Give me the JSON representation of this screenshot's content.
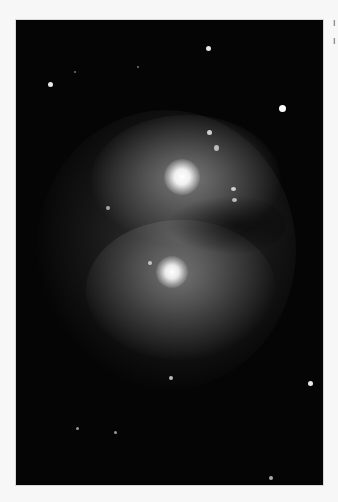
{
  "image": {
    "subject": "interacting spiral galaxies",
    "background_color": "#050505",
    "galaxies": [
      {
        "name": "upper-galaxy-core",
        "x": 166,
        "y": 157,
        "r": 12
      },
      {
        "name": "lower-galaxy-core",
        "x": 156,
        "y": 252,
        "r": 10
      }
    ],
    "stars": [
      {
        "x": 34,
        "y": 64,
        "r": 2.5
      },
      {
        "x": 192,
        "y": 28,
        "r": 2.5
      },
      {
        "x": 266,
        "y": 88,
        "r": 3.5
      },
      {
        "x": 59,
        "y": 52,
        "r": 1.2
      },
      {
        "x": 122,
        "y": 47,
        "r": 1.2
      },
      {
        "x": 155,
        "y": 358,
        "r": 2
      },
      {
        "x": 294,
        "y": 363,
        "r": 2.5
      },
      {
        "x": 62,
        "y": 409,
        "r": 1.8
      },
      {
        "x": 100,
        "y": 413,
        "r": 1.8
      },
      {
        "x": 255,
        "y": 458,
        "r": 1.8
      }
    ]
  },
  "side_text": {
    "line1": "I",
    "line2": "I"
  }
}
